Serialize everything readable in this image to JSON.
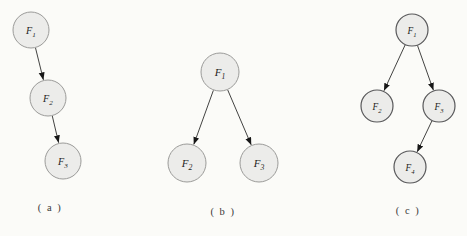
{
  "figure": {
    "background": "#fbfbf8",
    "node_fill": "#ececea",
    "edge_color": "#2e2e2c",
    "arrow_fill": "#171717",
    "label_color": "#232321",
    "caption_color": "#3a3a38",
    "diagrams": [
      {
        "id": "a",
        "caption": "( a )",
        "caption_x": 50,
        "caption_y": 211,
        "node_stroke": "#9b9b99",
        "node_stroke_width": 1,
        "nodes": [
          {
            "id": "F1",
            "label": "F",
            "sub": "1",
            "x": 31,
            "y": 30,
            "r": 18
          },
          {
            "id": "F2",
            "label": "F",
            "sub": "2",
            "x": 48,
            "y": 98,
            "r": 18
          },
          {
            "id": "F3",
            "label": "F",
            "sub": "3",
            "x": 63,
            "y": 161,
            "r": 18
          }
        ],
        "edges": [
          {
            "from": "F1",
            "to": "F2"
          },
          {
            "from": "F2",
            "to": "F3"
          }
        ]
      },
      {
        "id": "b",
        "caption": "( b )",
        "caption_x": 223,
        "caption_y": 215,
        "node_stroke": "#9b9b99",
        "node_stroke_width": 1,
        "nodes": [
          {
            "id": "F1",
            "label": "F",
            "sub": "1",
            "x": 220,
            "y": 72,
            "r": 19
          },
          {
            "id": "F2",
            "label": "F",
            "sub": "2",
            "x": 187,
            "y": 163,
            "r": 19
          },
          {
            "id": "F3",
            "label": "F",
            "sub": "3",
            "x": 259,
            "y": 163,
            "r": 19
          }
        ],
        "edges": [
          {
            "from": "F1",
            "to": "F2"
          },
          {
            "from": "F1",
            "to": "F3"
          }
        ]
      },
      {
        "id": "c",
        "caption": "( c )",
        "caption_x": 408,
        "caption_y": 214,
        "node_stroke": "#58585a",
        "node_stroke_width": 1.2,
        "nodes": [
          {
            "id": "F1",
            "label": "F",
            "sub": "1",
            "x": 412,
            "y": 30,
            "r": 16
          },
          {
            "id": "F2",
            "label": "F",
            "sub": "2",
            "x": 377,
            "y": 106,
            "r": 16
          },
          {
            "id": "F3",
            "label": "F",
            "sub": "3",
            "x": 439,
            "y": 106,
            "r": 16
          },
          {
            "id": "F4",
            "label": "F",
            "sub": "4",
            "x": 410,
            "y": 167,
            "r": 16
          }
        ],
        "edges": [
          {
            "from": "F1",
            "to": "F2"
          },
          {
            "from": "F1",
            "to": "F3"
          },
          {
            "from": "F3",
            "to": "F4"
          }
        ]
      }
    ]
  }
}
